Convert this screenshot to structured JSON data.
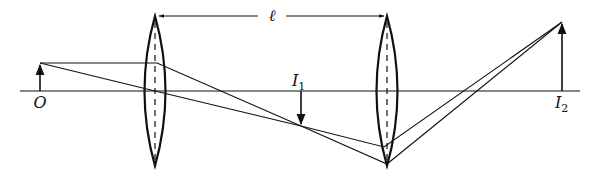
{
  "diagram": {
    "type": "optics-ray-diagram",
    "colors": {
      "stroke": "#111111",
      "background": "#ffffff"
    },
    "optical_axis": {
      "y": 91,
      "x1": 20,
      "x2": 580
    },
    "labels": {
      "object": "O",
      "separation": "ℓ",
      "image1": "I",
      "image1_sub": "1",
      "image2": "I",
      "image2_sub": "2"
    },
    "lenses": [
      {
        "name": "lens-1",
        "cx": 155,
        "top": 16,
        "bottom": 166,
        "half_width": 11
      },
      {
        "name": "lens-2",
        "cx": 387,
        "top": 16,
        "bottom": 166,
        "half_width": 11
      }
    ],
    "object": {
      "x": 40,
      "base_y": 91,
      "tip_y": 63,
      "direction": "up"
    },
    "image1": {
      "x": 301,
      "base_y": 91,
      "tip_y": 126,
      "direction": "down"
    },
    "image2": {
      "x": 562,
      "base_y": 91,
      "tip_y": 22,
      "direction": "up"
    },
    "separation_line": {
      "y": 16,
      "x1": 157,
      "x2": 385,
      "label_x": 272
    }
  }
}
